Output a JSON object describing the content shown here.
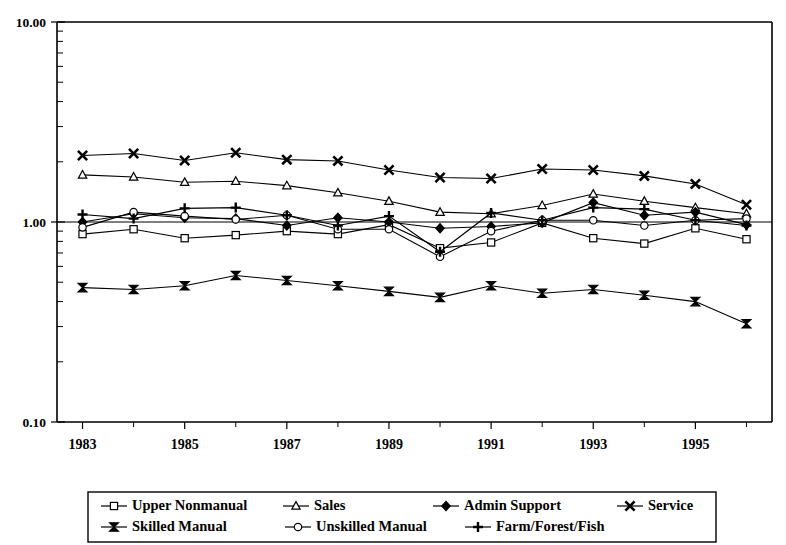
{
  "chart_data": {
    "type": "line",
    "title": "",
    "subtitle": "",
    "xlabel": "",
    "ylabel": "",
    "yscale": "log",
    "ylim": [
      0.1,
      10.0
    ],
    "ytick_labels": [
      "10.00",
      "1.00",
      "0.10"
    ],
    "ytick_values": [
      10.0,
      1.0,
      0.1
    ],
    "xtick_labels": [
      "1983",
      "1985",
      "1987",
      "1989",
      "1991",
      "1993",
      "1995"
    ],
    "xtick_values": [
      1983,
      1985,
      1987,
      1989,
      1991,
      1993,
      1995
    ],
    "x": [
      1983,
      1984,
      1985,
      1986,
      1987,
      1988,
      1989,
      1990,
      1991,
      1992,
      1993,
      1994,
      1995,
      1996
    ],
    "grid": "reference-line-at-1.00",
    "legend_position": "bottom",
    "series": [
      {
        "name": "Upper Nonmanual",
        "marker": "open-square",
        "values": [
          0.87,
          0.92,
          0.83,
          0.86,
          0.9,
          0.87,
          0.97,
          0.74,
          0.79,
          0.99,
          0.83,
          0.78,
          0.93,
          0.82
        ]
      },
      {
        "name": "Sales",
        "marker": "open-triangle",
        "values": [
          1.72,
          1.68,
          1.58,
          1.6,
          1.52,
          1.4,
          1.27,
          1.12,
          1.1,
          1.21,
          1.38,
          1.27,
          1.18,
          1.1
        ]
      },
      {
        "name": "Admin Support",
        "marker": "solid-diamond",
        "values": [
          1.0,
          1.1,
          1.05,
          1.04,
          0.96,
          1.05,
          1.0,
          0.93,
          0.95,
          0.99,
          1.25,
          1.08,
          1.12,
          0.97
        ]
      },
      {
        "name": "Service",
        "marker": "solid-x",
        "values": [
          2.15,
          2.2,
          2.03,
          2.22,
          2.05,
          2.02,
          1.82,
          1.67,
          1.65,
          1.84,
          1.82,
          1.7,
          1.55,
          1.22
        ]
      },
      {
        "name": "Skilled Manual",
        "marker": "solid-bowtie",
        "values": [
          0.47,
          0.46,
          0.48,
          0.54,
          0.51,
          0.48,
          0.45,
          0.42,
          0.48,
          0.44,
          0.46,
          0.43,
          0.4,
          0.31
        ]
      },
      {
        "name": "Unskilled Manual",
        "marker": "open-circle",
        "values": [
          0.94,
          1.12,
          1.07,
          1.03,
          1.08,
          0.92,
          0.92,
          0.67,
          0.9,
          1.02,
          1.02,
          0.96,
          1.02,
          1.04
        ]
      },
      {
        "name": "Farm/Forest/Fish",
        "marker": "plus",
        "values": [
          1.09,
          1.04,
          1.17,
          1.18,
          1.08,
          0.96,
          1.07,
          0.71,
          1.11,
          1.02,
          1.18,
          1.16,
          1.02,
          0.96
        ]
      }
    ]
  },
  "legend": {
    "items": [
      {
        "label": "Upper Nonmanual",
        "marker": "open-square"
      },
      {
        "label": "Sales",
        "marker": "open-triangle"
      },
      {
        "label": "Admin Support",
        "marker": "solid-diamond"
      },
      {
        "label": "Service",
        "marker": "solid-x"
      },
      {
        "label": "Skilled Manual",
        "marker": "solid-bowtie"
      },
      {
        "label": "Unskilled Manual",
        "marker": "open-circle"
      },
      {
        "label": "Farm/Forest/Fish",
        "marker": "plus"
      }
    ]
  }
}
